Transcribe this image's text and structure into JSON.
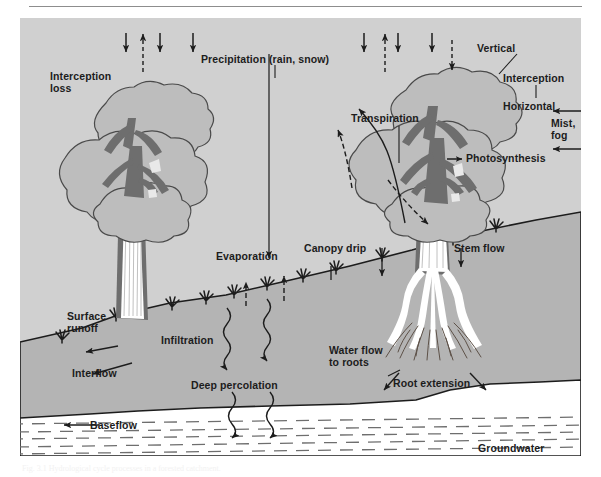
{
  "figure": {
    "caption": "Fig. 3.1  Hydrological cycle processes in a forested catchment.",
    "colors": {
      "page_background": "#ffffff",
      "panel_background": "#d0d0d0",
      "sky": "#d0d0d0",
      "soil": "#b4b4b4",
      "canopy_fill": "#bdbdbd",
      "canopy_outline": "#4a4a4a",
      "branch_dark": "#6e6e6e",
      "trunk_dark": "#6e6e6e",
      "stemflow_white": "#ffffff",
      "groundwater_fill": "#ffffff",
      "groundwater_dash": "#6e6e6e",
      "ink": "#1c1c1c",
      "rule": "#8d8d8d"
    },
    "labels": [
      {
        "id": "interception-loss",
        "text": "Interception\nloss",
        "x": 30,
        "y": 56
      },
      {
        "id": "precipitation",
        "text": "Precipitation (rain, snow)",
        "x": 201,
        "y": 41
      },
      {
        "id": "vertical",
        "text": "Vertical",
        "x": 459,
        "y": 31
      },
      {
        "id": "interception-right",
        "text": "Interception",
        "x": 503,
        "y": 60
      },
      {
        "id": "horizontal",
        "text": "Horizontal",
        "x": 503,
        "y": 88
      },
      {
        "id": "mist-fog",
        "text": "Mist,\nfog",
        "x": 548,
        "y": 105
      },
      {
        "id": "transpiration",
        "text": "Transpiration",
        "x": 351,
        "y": 100
      },
      {
        "id": "photosynthesis",
        "text": "Photosynthesis",
        "x": 449,
        "y": 137
      },
      {
        "id": "evaporation",
        "text": "Evaporation",
        "x": 218,
        "y": 249
      },
      {
        "id": "canopy-drip",
        "text": "Canopy drip",
        "x": 305,
        "y": 242
      },
      {
        "id": "stem-flow",
        "text": "Stem flow",
        "x": 452,
        "y": 242
      },
      {
        "id": "surface-runoff",
        "text": "Surface\nrunoff",
        "x": 67,
        "y": 308
      },
      {
        "id": "infiltration",
        "text": "Infiltration",
        "x": 161,
        "y": 331
      },
      {
        "id": "interflow",
        "text": "Interflow",
        "x": 72,
        "y": 365
      },
      {
        "id": "deep-percolation",
        "text": "Deep percolation",
        "x": 192,
        "y": 377
      },
      {
        "id": "water-flow-to-roots",
        "text": "Water flow\nto roots",
        "x": 329,
        "y": 342
      },
      {
        "id": "root-extension",
        "text": "Root extension",
        "x": 393,
        "y": 375
      },
      {
        "id": "baseflow",
        "text": "Baseflow",
        "x": 90,
        "y": 407
      },
      {
        "id": "groundwater",
        "text": "Groundwater",
        "x": 478,
        "y": 430
      }
    ],
    "processes": [
      "Precipitation (rain, snow)",
      "Interception loss",
      "Vertical interception",
      "Horizontal interception",
      "Mist, fog",
      "Transpiration",
      "Photosynthesis",
      "Evaporation",
      "Canopy drip",
      "Stem flow",
      "Surface runoff",
      "Infiltration",
      "Interflow",
      "Deep percolation",
      "Water flow to roots",
      "Root extension",
      "Baseflow",
      "Groundwater"
    ]
  }
}
